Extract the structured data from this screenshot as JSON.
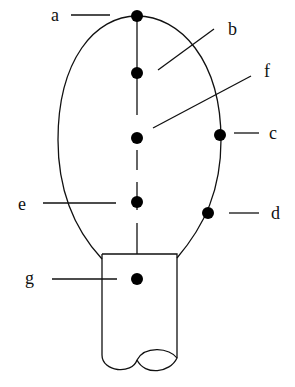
{
  "diagram": {
    "type": "structure diagram",
    "labels": {
      "a": "a",
      "b": "b",
      "c": "c",
      "d": "d",
      "e": "e",
      "f": "f",
      "g": "g"
    },
    "points": [
      {
        "id": "a",
        "x": 137,
        "y": 16
      },
      {
        "id": "b-dot",
        "x": 137,
        "y": 73
      },
      {
        "id": "f-dot",
        "x": 137,
        "y": 138
      },
      {
        "id": "c",
        "x": 220,
        "y": 135
      },
      {
        "id": "e",
        "x": 137,
        "y": 202
      },
      {
        "id": "d",
        "x": 208,
        "y": 213
      },
      {
        "id": "g",
        "x": 137,
        "y": 279
      }
    ],
    "colors": {
      "stroke": "#111111",
      "background": "#ffffff"
    }
  }
}
